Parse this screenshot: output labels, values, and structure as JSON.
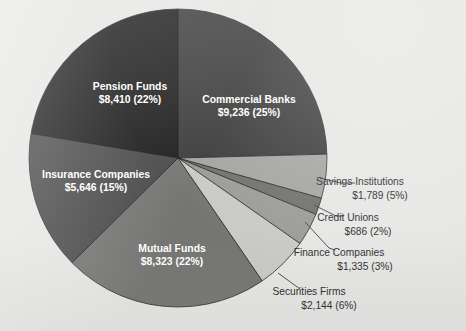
{
  "figure": {
    "background_color": "#e6e6e4",
    "center_x": 178,
    "center_y": 158,
    "radius": 149
  },
  "chart_data": {
    "type": "pie",
    "title": "",
    "xlabel": "",
    "ylabel": "",
    "units": "billions of dollars",
    "total": 37569,
    "start_angle_deg": 90,
    "direction": "clockwise",
    "legend": "none",
    "grid": false,
    "categories": [
      "Commercial Banks",
      "Savings Institutions",
      "Credit Unions",
      "Finance Companies",
      "Securities Firms",
      "Mutual Funds",
      "Insurance Companies",
      "Pension Funds"
    ],
    "values": [
      9236,
      1789,
      686,
      1335,
      2144,
      8323,
      5646,
      8410
    ],
    "percents": [
      25,
      5,
      2,
      3,
      6,
      22,
      15,
      22
    ],
    "value_labels": [
      "$9,236 (25%)",
      "$1,789 (5%)",
      "$686 (2%)",
      "$1,335 (3%)",
      "$2,144 (6%)",
      "$8,323 (22%)",
      "$5,646 (15%)",
      "$8,410 (22%)"
    ],
    "colors": [
      "#3a3a3a",
      "#a3a3a1",
      "#6f6f6d",
      "#9a9a98",
      "#c9c9c6",
      "#757573",
      "#4a4a4a",
      "#1c1c1c"
    ],
    "label_placement": [
      "inside",
      "outside",
      "outside",
      "outside",
      "outside",
      "inside",
      "inside",
      "inside"
    ]
  },
  "slices": [
    {
      "name": "Commercial Banks",
      "value_label": "$9,236 (25%)",
      "color": "#3a3a3a",
      "label_x": 249,
      "label_y": 103,
      "value_x": 249,
      "value_y": 116
    },
    {
      "name": "Savings Institutions",
      "value_label": "$1,789 (5%)",
      "color": "#a3a3a1",
      "label_x": 360,
      "label_y": 185,
      "value_x": 380,
      "value_y": 199,
      "leader": "M 320,178 L 341,183 L 355,183"
    },
    {
      "name": "Credit Unions",
      "value_label": "$686 (2%)",
      "color": "#6f6f6d",
      "label_x": 348,
      "label_y": 221,
      "value_x": 368,
      "value_y": 235,
      "leader": "M 314,205 L 336,216 L 344,216"
    },
    {
      "name": "Finance Companies",
      "value_label": "$1,335 (3%)",
      "color": "#9a9a98",
      "label_x": 339,
      "label_y": 256,
      "value_x": 365,
      "value_y": 270,
      "leader": "M 305,222 L 329,248 L 335,250"
    },
    {
      "name": "Securities Firms",
      "value_label": "$2,144 (6%)",
      "color": "#c9c9c6",
      "label_x": 309,
      "label_y": 295,
      "value_x": 329,
      "value_y": 309,
      "leader": "M 278,273 L 300,289"
    },
    {
      "name": "Mutual Funds",
      "value_label": "$8,323 (22%)",
      "color": "#757573",
      "label_x": 172,
      "label_y": 252,
      "value_x": 172,
      "value_y": 265
    },
    {
      "name": "Insurance Companies",
      "value_label": "$5,646 (15%)",
      "color": "#4a4a4a",
      "label_x": 96,
      "label_y": 178,
      "value_x": 96,
      "value_y": 191
    },
    {
      "name": "Pension Funds",
      "value_label": "$8,410 (22%)",
      "color": "#1c1c1c",
      "label_x": 130,
      "label_y": 90,
      "value_x": 130,
      "value_y": 103
    }
  ]
}
